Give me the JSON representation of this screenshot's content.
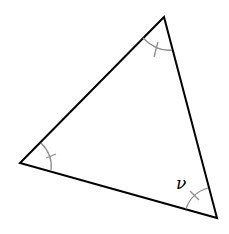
{
  "diagram": {
    "type": "triangle",
    "vertices": {
      "top": [
        164,
        17
      ],
      "left": [
        20,
        163
      ],
      "bottom_right": [
        217,
        218
      ]
    },
    "angle_label": "ν",
    "angle_label_vertex": "bottom_right",
    "angle_marks": [
      "top",
      "left",
      "bottom_right"
    ],
    "colors": {
      "edge": "#000000",
      "arc": "#8c8c8c"
    }
  }
}
